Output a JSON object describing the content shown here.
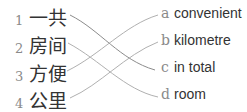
{
  "left_items": [
    {
      "number": "1",
      "text": "一共"
    },
    {
      "number": "2",
      "text": "房间"
    },
    {
      "number": "3",
      "text": "方便"
    },
    {
      "number": "4",
      "text": "公里"
    }
  ],
  "right_items": [
    {
      "letter": "a",
      "text": "convenient"
    },
    {
      "letter": "b",
      "text": "kilometre"
    },
    {
      "letter": "c",
      "text": "in total"
    },
    {
      "letter": "d",
      "text": "room"
    }
  ],
  "matches": [
    {
      "from": "1",
      "to": "c"
    },
    {
      "from": "2",
      "to": "d"
    },
    {
      "from": "3",
      "to": "a"
    },
    {
      "from": "4",
      "to": "b"
    }
  ],
  "colors": {
    "line": "#9a9a9a",
    "label": "#8a8a8a",
    "text": "#333333"
  }
}
